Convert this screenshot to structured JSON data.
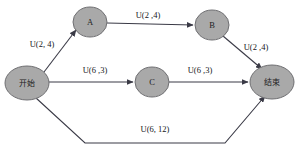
{
  "diagram": {
    "title": "",
    "node_fill_color": "#a9a9a9",
    "node_stroke_color": "#6f6f72",
    "edge_color": "#3a3a46",
    "background_color": "#ffffff",
    "nodes": [
      {
        "id": "start",
        "label": "开始",
        "script": "cjk",
        "cx": 27,
        "cy": 83,
        "rx": 22,
        "ry": 17
      },
      {
        "id": "A",
        "label": "A",
        "script": "latin",
        "cx": 90,
        "cy": 22,
        "rx": 17,
        "ry": 15
      },
      {
        "id": "B",
        "label": "B",
        "script": "latin",
        "cx": 212,
        "cy": 25,
        "rx": 17,
        "ry": 15
      },
      {
        "id": "C",
        "label": "C",
        "script": "latin",
        "cx": 152,
        "cy": 82,
        "rx": 17,
        "ry": 15
      },
      {
        "id": "end",
        "label": "结束",
        "script": "cjk",
        "cx": 272,
        "cy": 82,
        "rx": 22,
        "ry": 17
      }
    ],
    "edges": [
      {
        "id": "start-A",
        "from": "start",
        "to": "A",
        "label": "U(2, 4)",
        "label_x": 42,
        "label_y": 44
      },
      {
        "id": "A-B",
        "from": "A",
        "to": "B",
        "label": "U(2 ,4)",
        "label_x": 148,
        "label_y": 15
      },
      {
        "id": "B-end",
        "from": "B",
        "to": "end",
        "label": "U(2 ,4)",
        "label_x": 256,
        "label_y": 47
      },
      {
        "id": "start-C",
        "from": "start",
        "to": "C",
        "label": "U(6 ,3)",
        "label_x": 95,
        "label_y": 70
      },
      {
        "id": "C-end",
        "from": "C",
        "to": "end",
        "label": "U(6 ,3)",
        "label_x": 200,
        "label_y": 70
      },
      {
        "id": "start-end",
        "from": "start",
        "to": "end",
        "label": "U(6, 12)",
        "label_x": 155,
        "label_y": 129
      }
    ]
  }
}
